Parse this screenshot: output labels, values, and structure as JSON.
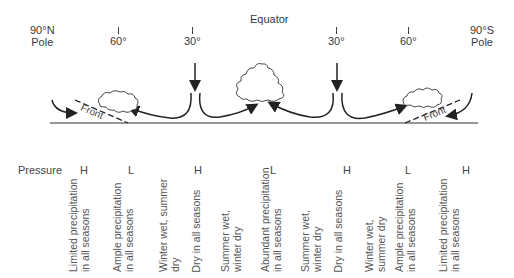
{
  "title": "Equator",
  "latitudes": [
    {
      "id": "np",
      "line1": "90°N",
      "line2": "Pole"
    },
    {
      "id": "n60",
      "label": "60°"
    },
    {
      "id": "n30",
      "label": "30°"
    },
    {
      "id": "s30",
      "label": "30°"
    },
    {
      "id": "s60",
      "label": "60°"
    },
    {
      "id": "sp",
      "line1": "90°S",
      "line2": "Pole"
    }
  ],
  "front_label": "Front",
  "pressure": {
    "label": "Pressure",
    "values": [
      "H",
      "L",
      "H",
      "L",
      "H",
      "L",
      "H"
    ]
  },
  "precipitation": [
    {
      "line1": "Limited precipitation",
      "line2": "in all seasons"
    },
    {
      "line1": "Ample precipitation",
      "line2": "in all seasons"
    },
    {
      "line1": "Winter wet, summer",
      "line2": "dry"
    },
    {
      "line1": "Dry in all seasons",
      "line2": ""
    },
    {
      "line1": "Summer wet,",
      "line2": "winter dry"
    },
    {
      "line1": "Abundant precipitation",
      "line2": "in all seasons"
    },
    {
      "line1": "Summer wet,",
      "line2": "winter dry"
    },
    {
      "line1": "Dry in all seasons",
      "line2": ""
    },
    {
      "line1": "Winter wet,",
      "line2": "summer dry"
    },
    {
      "line1": "Ample precipitation",
      "line2": "in all seasons"
    },
    {
      "line1": "Limited precipitation",
      "line2": "in all seasons"
    }
  ]
}
